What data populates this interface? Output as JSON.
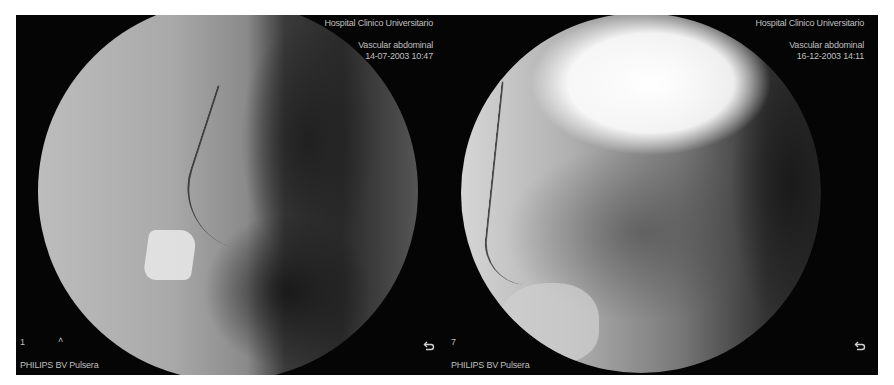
{
  "figure": {
    "background_color": "#ffffff",
    "strip_color": "#050505",
    "overlay_text_color": "#bfbfbf",
    "panels": [
      {
        "id": "left",
        "hospital": "Hospital Clinico Universitario",
        "study": "Vascular abdominal",
        "datetime": "14-07-2003  10:47",
        "frame_number": "1",
        "marker": "˄",
        "device": "PHILIPS BV Pulsera",
        "icon": "return-arrow-icon"
      },
      {
        "id": "right",
        "hospital": "Hospital Clinico Universitario",
        "study": "Vascular abdominal",
        "datetime": "16-12-2003  14:11",
        "frame_number": "7",
        "device": "PHILIPS BV Pulsera",
        "icon": "return-arrow-icon"
      }
    ]
  }
}
